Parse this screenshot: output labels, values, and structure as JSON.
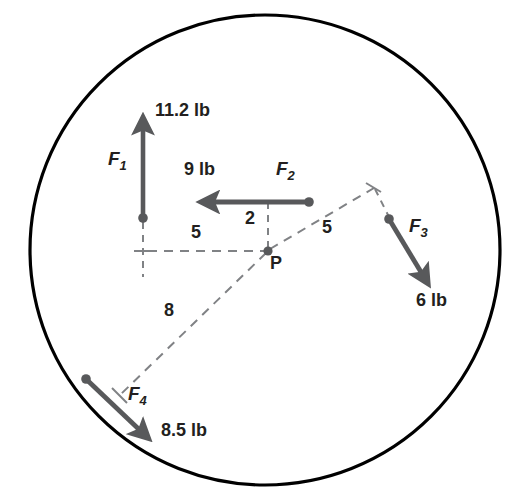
{
  "figure": {
    "colors": {
      "circle_stroke": "#000000",
      "vector": "#58595b",
      "dashed": "#808285",
      "text": "#231f20",
      "background": "#ffffff"
    },
    "boundary": {
      "shape": "circle",
      "center_x": 265,
      "center_y": 250,
      "radius": 235,
      "stroke_width": 3.2
    },
    "point_label": "P",
    "forces": [
      {
        "id": "F1",
        "label": "F",
        "subscript": "1",
        "magnitude": "11.2 lb",
        "direction": "up",
        "tail_x": 143,
        "tail_y": 218,
        "head_x": 143,
        "head_y": 113
      },
      {
        "id": "F2",
        "label": "F",
        "subscript": "2",
        "magnitude": "9 lb",
        "direction": "left",
        "tail_x": 309,
        "tail_y": 202,
        "head_x": 196,
        "head_y": 202
      },
      {
        "id": "F3",
        "label": "F",
        "subscript": "3",
        "magnitude": "6 lb",
        "direction": "down-right",
        "tail_x": 389,
        "tail_y": 219,
        "head_x": 433,
        "head_y": 292
      },
      {
        "id": "F4",
        "label": "F",
        "subscript": "4",
        "magnitude": "8.5 lb",
        "direction": "down-right",
        "tail_x": 86,
        "tail_y": 379,
        "head_x": 154,
        "head_y": 444
      }
    ],
    "dimensions": [
      {
        "id": "d5-horizontal",
        "value": "5",
        "label_x": 196,
        "label_y": 230
      },
      {
        "id": "d2-vertical",
        "value": "2",
        "label_x": 249,
        "label_y": 217
      },
      {
        "id": "d5-upright",
        "value": "5",
        "label_x": 326,
        "label_y": 225
      },
      {
        "id": "d8-downleft",
        "value": "8",
        "label_x": 168,
        "label_y": 307
      }
    ],
    "labels": {
      "f1_mag_x": 155,
      "f1_mag_y": 108,
      "f1_name_x": 110,
      "f1_name_y": 152,
      "f2_mag_x": 186,
      "f2_mag_y": 167,
      "f2_name_x": 277,
      "f2_name_y": 165,
      "f3_name_x": 411,
      "f3_name_y": 222,
      "f3_mag_x": 418,
      "f3_mag_y": 297,
      "f4_name_x": 130,
      "f4_name_y": 390,
      "f4_mag_x": 162,
      "f4_mag_y": 427,
      "p_x": 272,
      "p_y": 256
    },
    "construction": {
      "p_x": 268,
      "p_y": 251,
      "vertical_guide_x": 143,
      "vertical_guide_top": 222,
      "vertical_guide_bottom": 276,
      "horizontal_guide_y": 251,
      "vertical_drop_x": 268,
      "vertical_drop_top": 202,
      "upright_end_x": 374,
      "upright_end_y": 188,
      "downleft_end_x": 119,
      "downleft_end_y": 396,
      "f3_connector_x": 389,
      "f3_connector_y": 219
    }
  }
}
